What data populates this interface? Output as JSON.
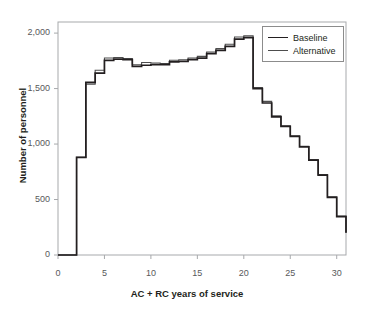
{
  "chart_data": {
    "type": "line",
    "step": true,
    "title": "",
    "xlabel": "AC + RC years of service",
    "ylabel": "Number of personnel",
    "xlim": [
      0,
      31
    ],
    "ylim": [
      0,
      2100
    ],
    "xticks": [
      0,
      5,
      10,
      15,
      20,
      25,
      30
    ],
    "xticklabels": [
      "0",
      "5",
      "10",
      "15",
      "20",
      "25",
      "30"
    ],
    "yticks": [
      0,
      500,
      1000,
      1500,
      2000
    ],
    "yticklabels": [
      "0",
      "500",
      "1,000",
      "1,500",
      "2,000"
    ],
    "grid": false,
    "legend_position": "top-right",
    "x": [
      0,
      1,
      2,
      3,
      4,
      5,
      6,
      7,
      8,
      9,
      10,
      11,
      12,
      13,
      14,
      15,
      16,
      17,
      18,
      19,
      20,
      21,
      22,
      23,
      24,
      25,
      26,
      27,
      28,
      29,
      30
    ],
    "series": [
      {
        "name": "Baseline",
        "color": "#231f20",
        "values": [
          0,
          0,
          880,
          1555,
          1640,
          1755,
          1765,
          1760,
          1700,
          1710,
          1715,
          1715,
          1740,
          1745,
          1760,
          1775,
          1815,
          1845,
          1880,
          1945,
          1960,
          1500,
          1370,
          1245,
          1160,
          1070,
          975,
          855,
          720,
          520,
          345
        ]
      },
      {
        "name": "Alternative",
        "color": "#4d4d4d",
        "values": [
          0,
          0,
          880,
          1540,
          1665,
          1775,
          1780,
          1770,
          1715,
          1735,
          1730,
          1725,
          1755,
          1760,
          1775,
          1790,
          1830,
          1860,
          1900,
          1965,
          1975,
          1510,
          1385,
          1255,
          1165,
          1075,
          980,
          860,
          725,
          525,
          350
        ]
      }
    ],
    "end_value": 200
  },
  "legend": {
    "items": [
      {
        "label": "Baseline"
      },
      {
        "label": "Alternative"
      }
    ]
  }
}
